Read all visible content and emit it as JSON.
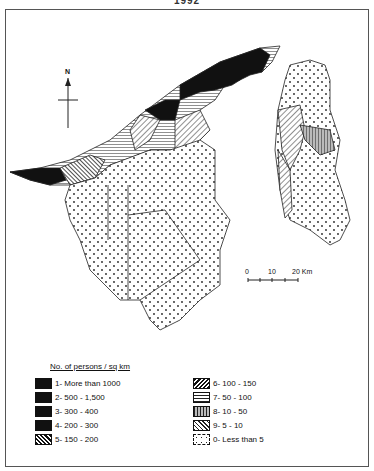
{
  "title": "1992",
  "north_label": "N",
  "scale": {
    "labels": [
      "0",
      "10",
      "20 Km"
    ]
  },
  "legend": {
    "title": "No. of persons / sq km",
    "items": [
      {
        "id": "1",
        "label": "1- More than 1000",
        "pattern": "solid-black"
      },
      {
        "id": "2",
        "label": "2- 500 - 1,500",
        "pattern": "solid-black"
      },
      {
        "id": "3",
        "label": "3- 300 - 400",
        "pattern": "solid-black"
      },
      {
        "id": "4",
        "label": "4- 200 - 300",
        "pattern": "solid-black"
      },
      {
        "id": "5",
        "label": "5- 150 - 200",
        "pattern": "dense-diagonal"
      },
      {
        "id": "6",
        "label": "6- 100 - 150",
        "pattern": "back-diagonal"
      },
      {
        "id": "7",
        "label": "7- 50 - 100",
        "pattern": "horizontal-lines"
      },
      {
        "id": "8",
        "label": "8- 10 - 50",
        "pattern": "vertical-lines"
      },
      {
        "id": "9",
        "label": "9- 5 - 10",
        "pattern": "diagonal"
      },
      {
        "id": "0",
        "label": "0- Less than 5",
        "pattern": "dots"
      }
    ]
  }
}
